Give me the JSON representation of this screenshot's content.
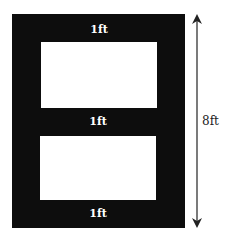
{
  "diagram": {
    "type": "frame-with-two-windows",
    "colors": {
      "frame": "#0d0d0d",
      "window": "#ffffff",
      "arrow": "#222222"
    },
    "labels": {
      "top_border": "1ft",
      "middle_border": "1ft",
      "bottom_border": "1ft",
      "height_dimension": "8ft"
    }
  }
}
